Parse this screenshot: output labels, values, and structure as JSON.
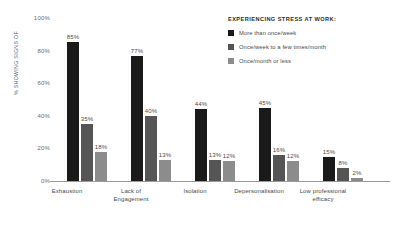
{
  "chart_data": {
    "type": "bar",
    "title": "",
    "subtitle": "",
    "xlabel": "",
    "ylabel": "% SHOWING SIGNS OF",
    "ylim": [
      0,
      100
    ],
    "ytick_labels": [
      "0%",
      "20%",
      "40%",
      "60%",
      "80%",
      "100%"
    ],
    "ytick_values": [
      0,
      20,
      40,
      60,
      80,
      100
    ],
    "grid": false,
    "legend_position": "top-right",
    "legend_title": "EXPERIENCING STRESS AT WORK:",
    "categories": [
      "Exhaustion",
      "Lack of\nEngagement",
      "Isolation",
      "Depersonalisation",
      "Low professional\nefficacy"
    ],
    "series": [
      {
        "name": "More than once/week",
        "color": "#1a1a1a",
        "values": [
          85,
          77,
          44,
          45,
          15
        ],
        "labels": [
          "85%",
          "77%",
          "44%",
          "45%",
          "15%"
        ]
      },
      {
        "name": "Once/week to a few times/month",
        "color": "#555555",
        "values": [
          35,
          40,
          13,
          16,
          8
        ],
        "labels": [
          "35%",
          "40%",
          "13%",
          "16%",
          "8%"
        ]
      },
      {
        "name": "Once/month or less",
        "color": "#8c8c8c",
        "values": [
          18,
          13,
          12,
          12,
          2
        ],
        "labels": [
          "18%",
          "13%",
          "12%",
          "12%",
          "2%"
        ]
      }
    ]
  },
  "axis": {
    "y_title": "% SHOWING SIGNS OF",
    "ticks": [
      "100%",
      "80%",
      "60%",
      "40%",
      "20%",
      "0%"
    ]
  },
  "categories": {
    "c0_line1": "Exhaustion",
    "c0_line2": "",
    "c1_line1": "Lack of",
    "c1_line2": "Engagement",
    "c2_line1": "Isolation",
    "c2_line2": "",
    "c3_line1": "Depersonalisation",
    "c3_line2": "",
    "c4_line1": "Low professional",
    "c4_line2": "efficacy"
  },
  "legend": {
    "title": "EXPERIENCING STRESS AT WORK:",
    "items": [
      {
        "label": "More than once/week",
        "color": "#1a1a1a"
      },
      {
        "label": "Once/week to a few times/month",
        "color": "#555555"
      },
      {
        "label": "Once/month or less",
        "color": "#8c8c8c"
      }
    ]
  }
}
